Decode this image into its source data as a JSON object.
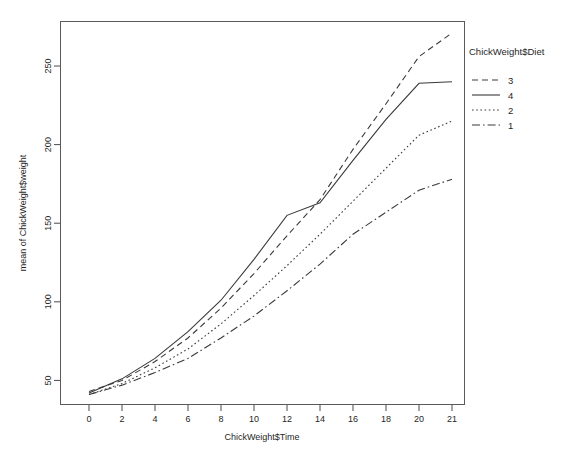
{
  "chart_data": {
    "type": "line",
    "title": "",
    "xlabel": "ChickWeight$Time",
    "ylabel": "mean of ChickWeight$weight",
    "x": [
      0,
      2,
      4,
      6,
      8,
      10,
      12,
      14,
      16,
      18,
      20,
      21
    ],
    "xtick_labels": [
      "0",
      "2",
      "4",
      "6",
      "8",
      "10",
      "12",
      "14",
      "16",
      "18",
      "20",
      "21"
    ],
    "ytick_labels": [
      "50",
      "100",
      "150",
      "200",
      "250"
    ],
    "ytick_values": [
      50,
      100,
      150,
      200,
      250
    ],
    "ylim": [
      35,
      278
    ],
    "grid": false,
    "legend_title": "ChickWeight$Diet",
    "legend_position": "right",
    "series": [
      {
        "name": "3",
        "legend_label": "3",
        "dash": "dashed",
        "dasharray": "6,4",
        "values": [
          43,
          50,
          62,
          77,
          96,
          118,
          142,
          165,
          197,
          226,
          256,
          271
        ]
      },
      {
        "name": "4",
        "legend_label": "4",
        "dash": "solid",
        "dasharray": "none",
        "values": [
          42,
          51,
          64,
          81,
          101,
          127,
          155,
          163,
          190,
          216,
          239,
          240
        ]
      },
      {
        "name": "2",
        "legend_label": "2",
        "dash": "dotted",
        "dasharray": "1.6,2.6",
        "values": [
          41,
          48,
          58,
          70,
          86,
          104,
          123,
          143,
          164,
          185,
          206,
          215
        ]
      },
      {
        "name": "1",
        "legend_label": "1",
        "dash": "dashdot",
        "dasharray": "8,3,1.6,3",
        "values": [
          41,
          47,
          55,
          64,
          77,
          91,
          107,
          124,
          143,
          157,
          171,
          178
        ]
      }
    ]
  },
  "legend": {
    "title": "ChickWeight$Diet",
    "entries": [
      {
        "label": "3",
        "style": "dashed"
      },
      {
        "label": "4",
        "style": "solid"
      },
      {
        "label": "2",
        "style": "dotted"
      },
      {
        "label": "1",
        "style": "dashdot"
      }
    ]
  },
  "axes": {
    "x_title": "ChickWeight$Time",
    "y_title": "mean of ChickWeight$weight"
  },
  "colors": {
    "line": "#3a3a3a",
    "axis": "#4a4a4a",
    "background": "#ffffff",
    "text": "#1f1f1f"
  }
}
